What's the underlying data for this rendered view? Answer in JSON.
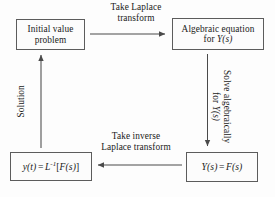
{
  "diagram": {
    "background_color": "#fdfdfd",
    "line_color": "#5c5c5c",
    "text_color": "#1a1a1a",
    "nodes": [
      {
        "id": "initial-value-problem",
        "line1": "Initial value",
        "line2": "problem"
      },
      {
        "id": "algebraic-equation",
        "line1": "Algebraic equation",
        "line2_prefix": "for ",
        "line2_var": "Y",
        "line2_arg": "(s)"
      },
      {
        "id": "inverse-transform-result",
        "y_var": "y",
        "y_arg": "(t)",
        "equals": "=",
        "L_var": "L",
        "L_exp": "-1",
        "bracket_open": "[",
        "F_var": "F",
        "F_arg": "(s)",
        "bracket_close": "]"
      },
      {
        "id": "transform-equation",
        "Y_var": "Y",
        "Y_arg": "(s)",
        "equals": "=",
        "F_var": "F",
        "F_arg": "(s)"
      }
    ],
    "edges": [
      {
        "id": "take-laplace-transform",
        "from": "initial-value-problem",
        "to": "algebraic-equation",
        "direction": "right",
        "line1": "Take Laplace",
        "line2": "transform"
      },
      {
        "id": "solve-algebraically",
        "from": "algebraic-equation",
        "to": "transform-equation",
        "direction": "down",
        "line1": "Solve algebraically",
        "line2_prefix": "for ",
        "line2_var": "Y",
        "line2_arg": "(s)"
      },
      {
        "id": "take-inverse-laplace-transform",
        "from": "transform-equation",
        "to": "inverse-transform-result",
        "direction": "left",
        "line1": "Take inverse",
        "line2": "Laplace transform"
      },
      {
        "id": "solution",
        "from": "inverse-transform-result",
        "to": "initial-value-problem",
        "direction": "up",
        "line1": "Solution"
      }
    ]
  }
}
